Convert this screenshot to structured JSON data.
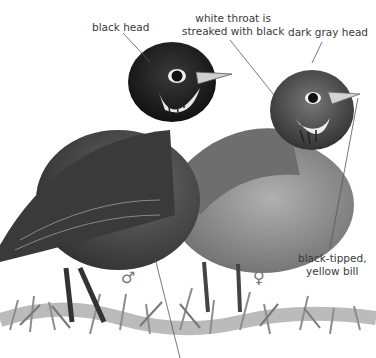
{
  "figure": {
    "labels": {
      "black_head": "black head",
      "white_throat_line1": "white throat is",
      "white_throat_line2": "streaked with black",
      "dark_gray_head": "dark gray head",
      "bill_line1": "black-tipped,",
      "bill_line2": "yellow bill"
    },
    "symbols": {
      "male": "♂",
      "female": "♀"
    },
    "colors": {
      "background": "#ffffff",
      "label_text": "#3a3a3a",
      "leader_line": "#555555",
      "male_head": "#1e1e1e",
      "male_body": "#4a4a4a",
      "female_head": "#555555",
      "female_body": "#8a8a8a",
      "grass": "#9a9a9a"
    }
  }
}
